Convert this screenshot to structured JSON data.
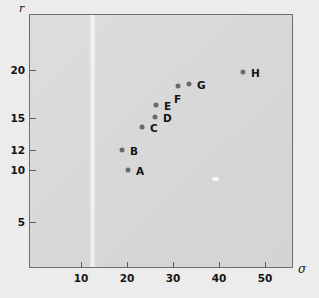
{
  "chart_data": {
    "type": "scatter",
    "title": "",
    "xlabel": "σ",
    "ylabel": "r",
    "xlim": [
      0,
      57
    ],
    "ylim": [
      0,
      22.5
    ],
    "grid": false,
    "legend": "none",
    "xticks": [
      10,
      20,
      30,
      40,
      50
    ],
    "xtick_labels": [
      "10",
      "20",
      "30",
      "40",
      "50"
    ],
    "yticks": [
      5,
      10,
      12,
      15,
      20
    ],
    "ytick_labels": [
      "5",
      "10",
      "12",
      "15",
      "20"
    ],
    "point_labels": [
      "A",
      "B",
      "C",
      "D",
      "E",
      "F",
      "G",
      "H"
    ],
    "x": [
      22.5,
      21.0,
      25.0,
      27.8,
      28.0,
      32.0,
      34.5,
      44.0
    ],
    "y": [
      10.0,
      12.1,
      14.5,
      15.7,
      17.0,
      18.5,
      18.7,
      19.8
    ],
    "points": [
      {
        "label": "A",
        "x": 22.5,
        "y": 10.0,
        "px": 128,
        "py": 170,
        "label_dx": 8,
        "label_dy": 1
      },
      {
        "label": "B",
        "x": 21.0,
        "y": 12.1,
        "px": 122,
        "py": 150,
        "label_dx": 8,
        "label_dy": 1
      },
      {
        "label": "C",
        "x": 25.0,
        "y": 14.5,
        "px": 142,
        "py": 127,
        "label_dx": 8,
        "label_dy": 1
      },
      {
        "label": "D",
        "x": 27.8,
        "y": 15.7,
        "px": 155,
        "py": 117,
        "label_dx": 8,
        "label_dy": 1
      },
      {
        "label": "E",
        "x": 28.0,
        "y": 17.0,
        "px": 156,
        "py": 105,
        "label_dx": 8,
        "label_dy": 1
      },
      {
        "label": "F",
        "x": 32.0,
        "y": 18.5,
        "px": 178,
        "py": 86,
        "label_dx": -4,
        "label_dy": 13
      },
      {
        "label": "G",
        "x": 34.5,
        "y": 18.7,
        "px": 189,
        "py": 84,
        "label_dx": 8,
        "label_dy": 1
      },
      {
        "label": "H",
        "x": 44.0,
        "y": 19.8,
        "px": 243,
        "py": 72,
        "label_dx": 8,
        "label_dy": 1
      }
    ]
  },
  "axes": {
    "y_axis_name": "r",
    "x_axis_name": "σ",
    "y_ticks": [
      {
        "label": "20",
        "py": 70
      },
      {
        "label": "15",
        "py": 118
      },
      {
        "label": "12",
        "py": 150
      },
      {
        "label": "10",
        "py": 170
      },
      {
        "label": "5",
        "py": 222
      }
    ],
    "x_ticks": [
      {
        "label": "10",
        "px": 81
      },
      {
        "label": "20",
        "px": 127
      },
      {
        "label": "30",
        "px": 173
      },
      {
        "label": "40",
        "px": 219
      },
      {
        "label": "50",
        "px": 265
      }
    ]
  },
  "colors": {
    "page_background": "#ececec",
    "panel_background": "#d7d7d7",
    "frame": "#6e6e6e",
    "point": "#6a6a6a",
    "text": "#151515"
  }
}
